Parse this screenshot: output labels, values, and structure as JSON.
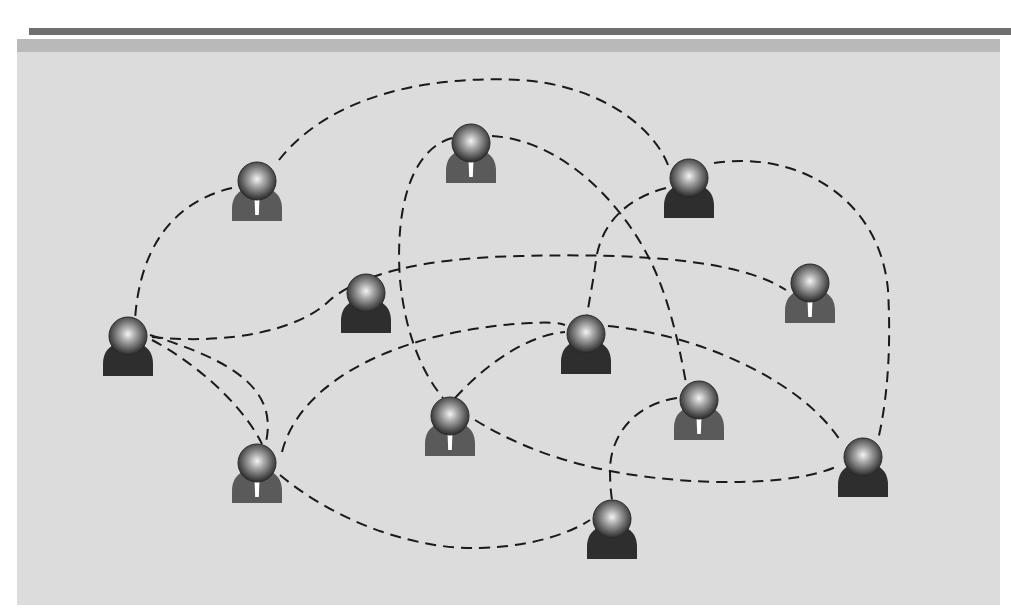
{
  "diagram": {
    "type": "social-network",
    "colors": {
      "top_rule": "#6f6f6f",
      "band": "#b9b9b9",
      "panel": "#dcdcdc",
      "edge": "#1a1a1a",
      "body_tie": "#5a5a5a",
      "body_plain": "#2e2e2e",
      "tie": "#ffffff"
    },
    "nodes": [
      {
        "id": "n1",
        "x": 257,
        "y": 185,
        "variant": "tie"
      },
      {
        "id": "n2",
        "x": 471,
        "y": 147,
        "variant": "tie"
      },
      {
        "id": "n3",
        "x": 689,
        "y": 182,
        "variant": "plain"
      },
      {
        "id": "n4",
        "x": 366,
        "y": 297,
        "variant": "plain"
      },
      {
        "id": "n5",
        "x": 810,
        "y": 287,
        "variant": "tie"
      },
      {
        "id": "n6",
        "x": 128,
        "y": 340,
        "variant": "plain"
      },
      {
        "id": "n7",
        "x": 586,
        "y": 338,
        "variant": "plain"
      },
      {
        "id": "n8",
        "x": 450,
        "y": 420,
        "variant": "tie"
      },
      {
        "id": "n9",
        "x": 699,
        "y": 404,
        "variant": "tie"
      },
      {
        "id": "n10",
        "x": 257,
        "y": 467,
        "variant": "tie"
      },
      {
        "id": "n11",
        "x": 863,
        "y": 461,
        "variant": "plain"
      },
      {
        "id": "n12",
        "x": 612,
        "y": 523,
        "variant": "plain"
      }
    ],
    "edges": [
      {
        "from": "n1",
        "to": "n3",
        "d": "M279,160 C330,95 430,75 520,80 C590,84 650,120 668,165"
      },
      {
        "from": "n1",
        "to": "n6",
        "d": "M232,188 C180,200 140,240 135,320"
      },
      {
        "from": "n2",
        "to": "n8",
        "d": "M452,138 C410,150 395,210 400,280 C405,330 420,370 443,398"
      },
      {
        "from": "n2",
        "to": "n9",
        "d": "M492,136 C560,140 620,200 650,260 C670,300 680,350 686,383"
      },
      {
        "from": "n3",
        "to": "n7",
        "d": "M666,188 C620,200 600,230 596,260 C592,290 588,305 587,318"
      },
      {
        "from": "n3",
        "to": "n11",
        "d": "M714,163 C800,150 880,200 888,290 C892,360 885,410 878,440"
      },
      {
        "from": "n6",
        "to": "n5",
        "d": "M152,337 C230,345 300,330 330,300 C360,275 420,258 520,256 C640,253 740,260 786,290"
      },
      {
        "from": "n6",
        "to": "n8",
        "d": "M150,335 C230,360 290,390 260,460"
      },
      {
        "from": "n6",
        "to": "n10",
        "d": "M152,340 C190,360 240,400 262,444"
      },
      {
        "from": "n8",
        "to": "n7",
        "d": "M455,398 C490,360 530,335 565,332"
      },
      {
        "from": "n10",
        "to": "n7",
        "d": "M282,452 C300,380 400,330 530,323 C550,322 560,323 565,325"
      },
      {
        "from": "n7",
        "to": "n11",
        "d": "M608,326 C700,335 800,380 840,440"
      },
      {
        "from": "n8",
        "to": "n11",
        "d": "M475,420 C540,460 620,480 720,482 C780,483 820,475 840,465"
      },
      {
        "from": "n9",
        "to": "n12",
        "d": "M677,398 C630,405 610,440 610,470 C610,485 611,493 612,500"
      },
      {
        "from": "n10",
        "to": "n12",
        "d": "M280,475 C340,525 420,550 480,548 C540,546 575,530 590,520"
      }
    ]
  }
}
